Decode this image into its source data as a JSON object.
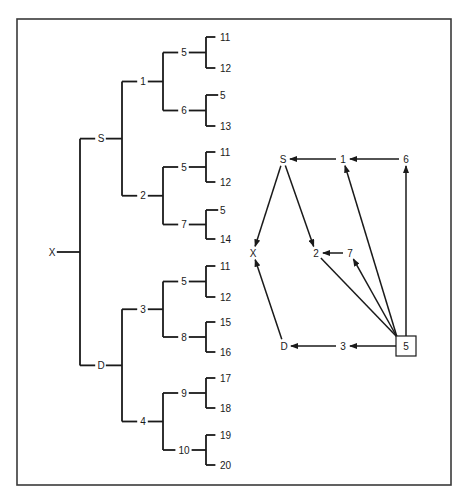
{
  "figure": {
    "tree": {
      "label": "X",
      "children": [
        {
          "label": "S",
          "children": [
            {
              "label": "1",
              "children": [
                {
                  "label": "5",
                  "children": [
                    {
                      "label": "11"
                    },
                    {
                      "label": "12"
                    }
                  ]
                },
                {
                  "label": "6",
                  "children": [
                    {
                      "label": "5"
                    },
                    {
                      "label": "13"
                    }
                  ]
                }
              ]
            },
            {
              "label": "2",
              "children": [
                {
                  "label": "5",
                  "children": [
                    {
                      "label": "11"
                    },
                    {
                      "label": "12"
                    }
                  ]
                },
                {
                  "label": "7",
                  "children": [
                    {
                      "label": "5"
                    },
                    {
                      "label": "14"
                    }
                  ]
                }
              ]
            }
          ]
        },
        {
          "label": "D",
          "children": [
            {
              "label": "3",
              "children": [
                {
                  "label": "5",
                  "children": [
                    {
                      "label": "11"
                    },
                    {
                      "label": "12"
                    }
                  ]
                },
                {
                  "label": "8",
                  "children": [
                    {
                      "label": "15"
                    },
                    {
                      "label": "16"
                    }
                  ]
                }
              ]
            },
            {
              "label": "4",
              "children": [
                {
                  "label": "9",
                  "children": [
                    {
                      "label": "17"
                    },
                    {
                      "label": "18"
                    }
                  ]
                },
                {
                  "label": "10",
                  "children": [
                    {
                      "label": "19"
                    },
                    {
                      "label": "20"
                    }
                  ]
                }
              ]
            }
          ]
        }
      ]
    },
    "graph": {
      "nodes": [
        {
          "id": "S",
          "label": "S"
        },
        {
          "id": "1",
          "label": "1"
        },
        {
          "id": "6",
          "label": "6"
        },
        {
          "id": "X",
          "label": "X"
        },
        {
          "id": "2",
          "label": "2"
        },
        {
          "id": "7",
          "label": "7"
        },
        {
          "id": "D",
          "label": "D"
        },
        {
          "id": "3",
          "label": "3"
        },
        {
          "id": "5",
          "label": "5",
          "boxed": true
        }
      ],
      "edges": [
        {
          "from": "1",
          "to": "S",
          "arrow": true
        },
        {
          "from": "6",
          "to": "1",
          "arrow": true
        },
        {
          "from": "S",
          "to": "X",
          "arrow": true
        },
        {
          "from": "S",
          "to": "2",
          "arrow": true
        },
        {
          "from": "7",
          "to": "2",
          "arrow": true
        },
        {
          "from": "D",
          "to": "X",
          "arrow": true
        },
        {
          "from": "3",
          "to": "D",
          "arrow": true
        },
        {
          "from": "5",
          "to": "3",
          "arrow": true
        },
        {
          "from": "5",
          "to": "6",
          "arrow": true
        },
        {
          "from": "5",
          "to": "1",
          "arrow": true
        },
        {
          "from": "5",
          "to": "7",
          "arrow": true
        },
        {
          "from": "5",
          "to": "2",
          "arrow": false
        }
      ]
    }
  }
}
